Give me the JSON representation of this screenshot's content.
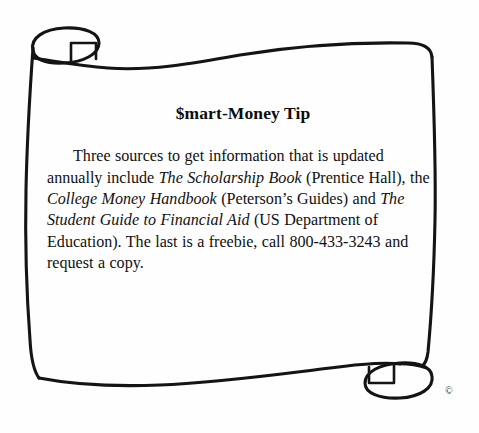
{
  "illustration": {
    "name": "parchment-scroll",
    "description": "hand-drawn curled scroll / banner outline",
    "line_color": "#141414",
    "paper_color": "#fefefe"
  },
  "tip": {
    "title": "$mart-Money Tip",
    "body": {
      "segment_1": "Three sources to get information that is updated annually include ",
      "book_1": "The Scholarship Book",
      "segment_2": " (Prentice Hall), the ",
      "book_2": "College Money Handbook",
      "segment_3": " (Peterson’s Guides) and ",
      "book_3": "The Student Guide to Financial Aid",
      "segment_4": " (US Department of Education). The last is a freebie, call 800-433-3243 and request a copy."
    },
    "phone": "800-433-3243"
  },
  "footer": {
    "copyright_symbol": "©"
  }
}
